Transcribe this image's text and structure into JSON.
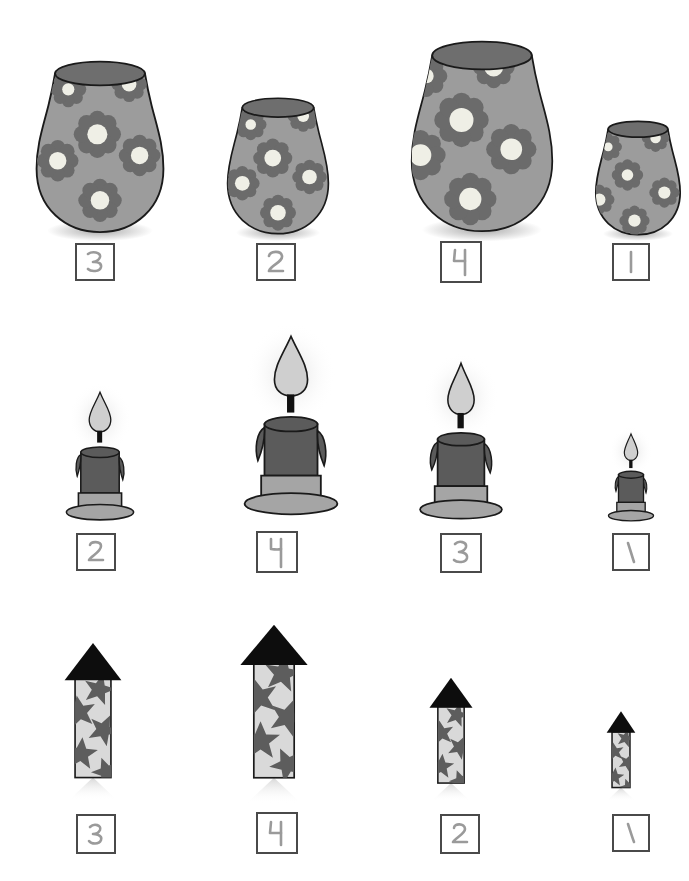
{
  "worksheet": {
    "title": "Size ordering worksheet",
    "description": "Three rows of objects ordered by size with handwritten number boxes beneath each",
    "page_width": 689,
    "page_height": 881,
    "background_color": "#ffffff"
  },
  "palette": {
    "vase_body": "#9c9c9c",
    "vase_rim": "#6e6e6e",
    "vase_petal": "#6b6b6b",
    "vase_center": "#efefe6",
    "vase_outline": "#1a1a1a",
    "candle_wax": "#5b5b5b",
    "candle_base": "#a5a5a5",
    "candle_flame": "#cfcfcf",
    "candle_wick": "#111111",
    "rocket_cone": "#0d0d0d",
    "rocket_body": "#d9d9d9",
    "rocket_star": "#5d5d5d",
    "box_border": "#4a4a4a",
    "pencil": "#9a9a9a"
  },
  "rows": [
    {
      "name": "vases",
      "object_label": "flower vase",
      "items": [
        {
          "answer": "3",
          "rank_label": "third-largest",
          "x": 30,
          "y": 55,
          "w": 140,
          "h": 185,
          "box_x": 75,
          "box_y": 243,
          "box_w": 40,
          "box_h": 38
        },
        {
          "answer": "2",
          "rank_label": "second-largest",
          "x": 222,
          "y": 93,
          "w": 112,
          "h": 147,
          "box_x": 256,
          "box_y": 243,
          "box_w": 40,
          "box_h": 38
        },
        {
          "answer": "4",
          "rank_label": "largest",
          "x": 396,
          "y": 35,
          "w": 172,
          "h": 205,
          "box_x": 440,
          "box_y": 241,
          "box_w": 42,
          "box_h": 42
        },
        {
          "answer": "1",
          "rank_label": "smallest",
          "x": 594,
          "y": 117,
          "w": 88,
          "h": 123,
          "box_x": 612,
          "box_y": 243,
          "box_w": 38,
          "box_h": 38
        }
      ]
    },
    {
      "name": "candles",
      "object_label": "lit candle",
      "items": [
        {
          "answer": "2",
          "rank_label": "second-tallest",
          "x": 58,
          "y": 385,
          "w": 84,
          "h": 138,
          "box_x": 76,
          "box_y": 533,
          "box_w": 40,
          "box_h": 38
        },
        {
          "answer": "4",
          "rank_label": "tallest",
          "x": 233,
          "y": 326,
          "w": 116,
          "h": 198,
          "box_x": 256,
          "box_y": 531,
          "box_w": 42,
          "box_h": 42
        },
        {
          "answer": "3",
          "rank_label": "third-tallest",
          "x": 409,
          "y": 356,
          "w": 104,
          "h": 168,
          "box_x": 440,
          "box_y": 533,
          "box_w": 42,
          "box_h": 40
        },
        {
          "answer": "1",
          "rank_label": "shortest",
          "x": 594,
          "y": 428,
          "w": 74,
          "h": 96,
          "box_x": 612,
          "box_y": 533,
          "box_w": 38,
          "box_h": 38
        }
      ]
    },
    {
      "name": "rockets",
      "object_label": "star firework rocket",
      "items": [
        {
          "answer": "3",
          "rank_label": "third-tallest",
          "x": 60,
          "y": 640,
          "w": 66,
          "h": 145,
          "box_x": 76,
          "box_y": 814,
          "box_w": 40,
          "box_h": 40
        },
        {
          "answer": "4",
          "rank_label": "tallest",
          "x": 232,
          "y": 623,
          "w": 84,
          "h": 163,
          "box_x": 256,
          "box_y": 812,
          "box_w": 42,
          "box_h": 42
        },
        {
          "answer": "2",
          "rank_label": "second-tallest",
          "x": 423,
          "y": 673,
          "w": 56,
          "h": 113,
          "box_x": 440,
          "box_y": 814,
          "box_w": 40,
          "box_h": 40
        },
        {
          "answer": "1",
          "rank_label": "shortest",
          "x": 598,
          "y": 705,
          "w": 46,
          "h": 81,
          "box_x": 612,
          "box_y": 814,
          "box_w": 38,
          "box_h": 38
        }
      ]
    }
  ]
}
